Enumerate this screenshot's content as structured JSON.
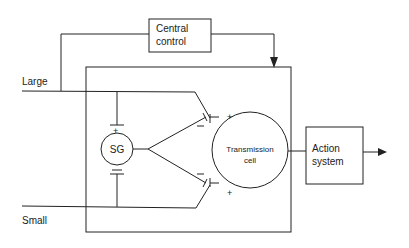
{
  "diagram": {
    "nodes": {
      "central_control": {
        "line1": "Central",
        "line2": "control"
      },
      "sg": {
        "label": "SG"
      },
      "transmission_cell": {
        "line1": "Transmission",
        "line2": "cell"
      },
      "action_system": {
        "line1": "Action",
        "line2": "system"
      }
    },
    "inputs": {
      "large": "Large",
      "small": "Small"
    },
    "signs": {
      "plus": "+",
      "minus": "−"
    },
    "colors": {
      "stroke": "#222222",
      "background": "#ffffff"
    }
  }
}
